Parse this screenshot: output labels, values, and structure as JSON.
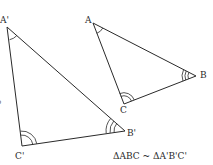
{
  "figure": {
    "type": "similar-triangles",
    "caption": "ΔABC ~ ΔA'B'C'",
    "edge_mark": "o",
    "line_color": "#2a2a2a",
    "background": "#ffffff"
  },
  "triangles": [
    {
      "name": "A'B'C'",
      "vertices": [
        {
          "label": "A'",
          "x": 7,
          "y": 27,
          "arcs": 1
        },
        {
          "label": "B'",
          "x": 125,
          "y": 131,
          "arcs": 3
        },
        {
          "label": "C'",
          "x": 22,
          "y": 146,
          "arcs": 2
        }
      ]
    },
    {
      "name": "ABC",
      "vertices": [
        {
          "label": "A",
          "x": 93,
          "y": 23,
          "arcs": 1
        },
        {
          "label": "B",
          "x": 196,
          "y": 76,
          "arcs": 3
        },
        {
          "label": "C",
          "x": 124,
          "y": 104,
          "arcs": 2
        }
      ]
    }
  ],
  "labels": {
    "a_prime": "A'",
    "b_prime": "B'",
    "c_prime": "C'",
    "a": "A",
    "b": "B",
    "c": "C"
  }
}
